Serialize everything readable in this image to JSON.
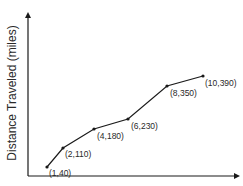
{
  "chart_data": {
    "type": "line",
    "title": "",
    "xlabel": "",
    "ylabel": "Distance Traveled (miles)",
    "grid": false,
    "legend": null,
    "x": [
      1,
      2,
      4,
      6,
      8,
      10
    ],
    "values": [
      40,
      110,
      180,
      230,
      350,
      390
    ],
    "point_labels": [
      "(1,40)",
      "(2,110)",
      "(4,180)",
      "(6,230)",
      "(8,350)",
      "(10,390)"
    ],
    "xlim": [
      0,
      11.5
    ],
    "ylim": [
      0,
      450
    ],
    "axis_ticks": "none",
    "colors": {
      "line": "#1a1a1a",
      "axis": "#1a1a1a",
      "text": "#2a2a2a",
      "background": "#ffffff"
    }
  },
  "layout": {
    "origin_px": [
      28,
      176
    ],
    "x_axis_end_px": 240,
    "y_axis_end_px": 12,
    "points_px": [
      [
        47,
        167
      ],
      [
        63,
        148
      ],
      [
        94,
        129
      ],
      [
        128,
        119
      ],
      [
        167,
        86
      ],
      [
        203,
        76
      ]
    ],
    "label_offsets_px": [
      [
        2,
        7
      ],
      [
        2,
        7
      ],
      [
        3,
        8
      ],
      [
        3,
        8
      ],
      [
        3,
        8
      ],
      [
        2,
        8
      ]
    ]
  }
}
